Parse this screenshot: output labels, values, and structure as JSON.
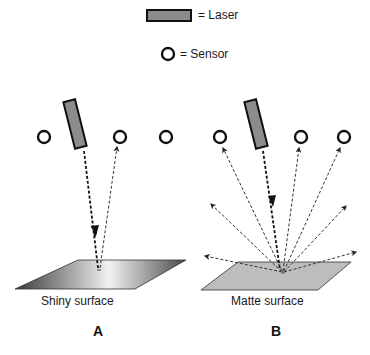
{
  "legend": {
    "laser_label": "= Laser",
    "sensor_label": "= Sensor"
  },
  "panels": [
    {
      "id": "A",
      "letter": "A",
      "surface_label": "Shiny surface",
      "surface_type": "shiny"
    },
    {
      "id": "B",
      "letter": "B",
      "surface_label": "Matte surface",
      "surface_type": "matte"
    }
  ],
  "colors": {
    "laser_fill": "#8c8c8c",
    "outline": "#111111",
    "matte_fill": "#bdbdbd",
    "ray": "#333333"
  }
}
